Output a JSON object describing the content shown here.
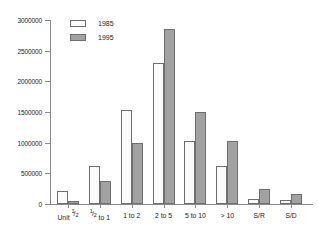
{
  "chart_data": {
    "type": "bar",
    "title": "",
    "subtitle": "",
    "xlabel": "",
    "ylabel": "",
    "categories": [
      "Unit 1/2",
      "1/2 to 1",
      "1 to 2",
      "2 to 5",
      "5 to 10",
      "> 10",
      "S/R",
      "S/D"
    ],
    "category_labels_display": [
      "Unit ½",
      "½ to 1",
      "1 to 2",
      "2 to 5",
      "5 to 10",
      "> 10",
      "S/R",
      "S/D"
    ],
    "series": [
      {
        "name": "1985",
        "color": "#fbfbfb",
        "values": [
          220000,
          615000,
          1540000,
          2300000,
          1030000,
          620000,
          80000,
          65000
        ]
      },
      {
        "name": "1995",
        "color": "#a2a2a2",
        "values": [
          45000,
          370000,
          1000000,
          2860000,
          1495000,
          1030000,
          250000,
          165000
        ]
      }
    ],
    "ylim": [
      0,
      3000000
    ],
    "yticks": [
      0,
      500000,
      1000000,
      1500000,
      2000000,
      2500000,
      3000000
    ],
    "ytick_labels": [
      "0",
      "500000",
      "1000000",
      "1500000",
      "2000000",
      "2500000",
      "3000000"
    ],
    "grid": false,
    "legend_position": "top-left",
    "axis_color": "#8a8a8a",
    "bar_outline_color": "#6e6e6e"
  },
  "legend": {
    "entries": [
      {
        "label": "1985"
      },
      {
        "label": "1995"
      }
    ]
  }
}
